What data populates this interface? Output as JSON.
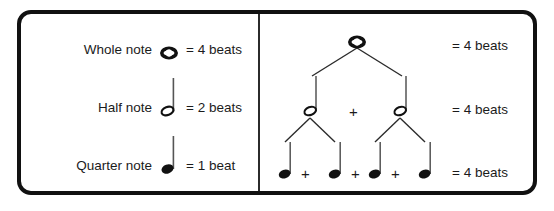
{
  "legend": {
    "rows": [
      {
        "label": "Whole note",
        "note": "whole-note",
        "value": "= 4 beats"
      },
      {
        "label": "Half note",
        "note": "half-note",
        "value": "= 2 beats"
      },
      {
        "label": "Quarter note",
        "note": "quarter-note",
        "value": "= 1 beat"
      }
    ]
  },
  "tree": {
    "levels": [
      {
        "name": "whole-note-level",
        "notes": [
          "whole-note"
        ],
        "separators": [],
        "beats": "= 4 beats"
      },
      {
        "name": "half-note-level",
        "notes": [
          "half-note",
          "half-note"
        ],
        "separators": [
          "+"
        ],
        "beats": "= 4 beats"
      },
      {
        "name": "quarter-note-level",
        "notes": [
          "quarter-note",
          "quarter-note",
          "quarter-note",
          "quarter-note"
        ],
        "separators": [
          "+",
          "+",
          "+"
        ],
        "beats": "= 4 beats"
      }
    ]
  },
  "symbols": {
    "plus": "+"
  },
  "colors": {
    "ink": "#1b1b1b",
    "border": "#111111",
    "background": "#ffffff",
    "divider": "#2b2b2b"
  }
}
